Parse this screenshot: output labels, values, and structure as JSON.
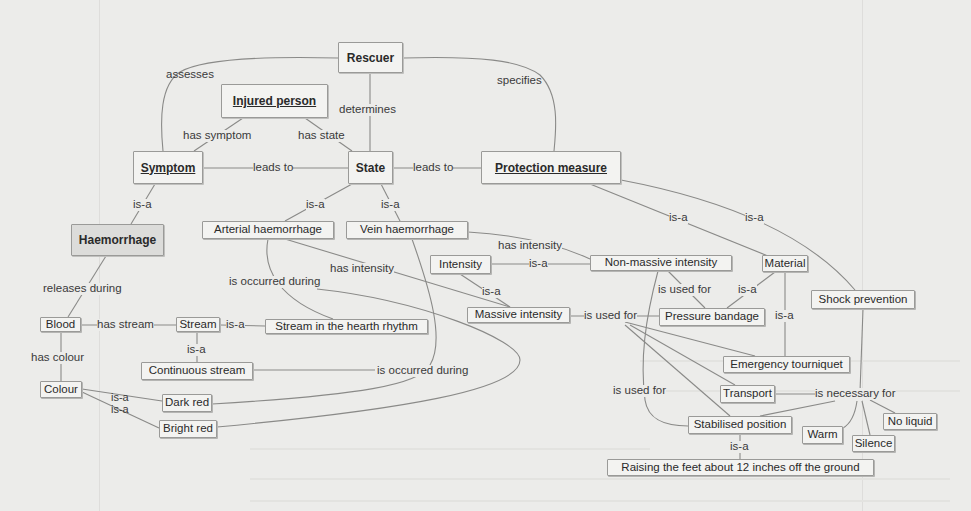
{
  "diagram": {
    "type": "concept-map",
    "nodes": {
      "rescuer": "Rescuer",
      "injured_person": "Injured person",
      "symptom": "Symptom",
      "state": "State",
      "protection_measure": "Protection measure",
      "haemorrhage": "Haemorrhage",
      "arterial_haemorrhage": "Arterial haemorrhage",
      "vein_haemorrhage": "Vein haemorrhage",
      "intensity": "Intensity",
      "non_massive_intensity": "Non-massive intensity",
      "material": "Material",
      "massive_intensity": "Massive intensity",
      "pressure_bandage": "Pressure bandage",
      "shock_prevention": "Shock prevention",
      "blood": "Blood",
      "stream": "Stream",
      "stream_heart_rhythm": "Stream in the hearth rhythm",
      "continuous_stream": "Continuous stream",
      "colour": "Colour",
      "dark_red": "Dark red",
      "bright_red": "Bright red",
      "emergency_tourniquet": "Emergency tourniquet",
      "transport": "Transport",
      "stabilised_position": "Stabilised position",
      "warm": "Warm",
      "silence": "Silence",
      "no_liquid": "No liquid",
      "raising_feet": "Raising the feet about 12 inches off the ground"
    },
    "links": {
      "assesses": "assesses",
      "determines": "determines",
      "specifies": "specifies",
      "has_symptom": "has symptom",
      "has_state": "has state",
      "leads_to_1": "leads to",
      "leads_to_2": "leads to",
      "isa_symptom_haem": "is-a",
      "isa_state_arterial": "is-a",
      "isa_state_vein": "is-a",
      "isa_pm_material": "is-a",
      "isa_pm_shock": "is-a",
      "has_intensity_vein": "has intensity",
      "has_intensity_arterial": "has intensity",
      "is_occurred_during_1": "is occurred during",
      "is_occurred_during_2": "is occurred during",
      "releases_during": "releases during",
      "isa_intensity_nonmassive": "is-a",
      "isa_intensity_massive": "is-a",
      "is_used_for_nonmassive": "is used for",
      "isa_material_pressure": "is-a",
      "isa_material_tourniquet": "is-a",
      "is_used_for_massive": "is used for",
      "is_used_for_left": "is used for",
      "has_stream": "has stream",
      "isa_stream_rhythm": "is-a",
      "isa_stream_continuous": "is-a",
      "has_colour": "has colour",
      "isa_colour_dark": "is-a",
      "isa_colour_bright": "is-a",
      "is_necessary_for": "is necessary for",
      "isa_stabilised_raising": "is-a"
    },
    "edges": [
      [
        "Rescuer",
        "assesses",
        "Symptom"
      ],
      [
        "Rescuer",
        "determines",
        "State"
      ],
      [
        "Rescuer",
        "specifies",
        "Protection measure"
      ],
      [
        "Injured person",
        "has symptom",
        "Symptom"
      ],
      [
        "Injured person",
        "has state",
        "State"
      ],
      [
        "Symptom",
        "leads to",
        "State"
      ],
      [
        "State",
        "leads to",
        "Protection measure"
      ],
      [
        "Haemorrhage",
        "is-a",
        "Symptom"
      ],
      [
        "Arterial haemorrhage",
        "is-a",
        "State"
      ],
      [
        "Vein haemorrhage",
        "is-a",
        "State"
      ],
      [
        "Material",
        "is-a",
        "Protection measure"
      ],
      [
        "Shock prevention",
        "is-a",
        "Protection measure"
      ],
      [
        "Vein haemorrhage",
        "has intensity",
        "Non-massive intensity"
      ],
      [
        "Arterial haemorrhage",
        "has intensity",
        "Massive intensity"
      ],
      [
        "Arterial haemorrhage",
        "is occurred during",
        "Stream in the hearth rhythm"
      ],
      [
        "Vein haemorrhage",
        "is occurred during",
        "Continuous stream"
      ],
      [
        "Haemorrhage",
        "releases during",
        "Blood"
      ],
      [
        "Non-massive intensity",
        "is-a",
        "Intensity"
      ],
      [
        "Massive intensity",
        "is-a",
        "Intensity"
      ],
      [
        "Pressure bandage",
        "is used for",
        "Non-massive intensity"
      ],
      [
        "Pressure bandage",
        "is-a",
        "Material"
      ],
      [
        "Emergency tourniquet",
        "is-a",
        "Material"
      ],
      [
        "Massive intensity",
        "is used for",
        "Pressure bandage"
      ],
      [
        "Massive intensity",
        "is used for",
        "Emergency tourniquet"
      ],
      [
        "Massive intensity",
        "is used for",
        "Transport"
      ],
      [
        "Massive intensity",
        "is used for",
        "Stabilised position"
      ],
      [
        "Stabilised position",
        "is used for",
        "Non-massive intensity"
      ],
      [
        "Blood",
        "has stream",
        "Stream"
      ],
      [
        "Stream in the hearth rhythm",
        "is-a",
        "Stream"
      ],
      [
        "Continuous stream",
        "is-a",
        "Stream"
      ],
      [
        "Blood",
        "has colour",
        "Colour"
      ],
      [
        "Dark red",
        "is-a",
        "Colour"
      ],
      [
        "Bright red",
        "is-a",
        "Colour"
      ],
      [
        "Shock prevention",
        "is necessary for",
        "Transport"
      ],
      [
        "Shock prevention",
        "is necessary for",
        "Stabilised position"
      ],
      [
        "Shock prevention",
        "is necessary for",
        "Warm"
      ],
      [
        "Shock prevention",
        "is necessary for",
        "Silence"
      ],
      [
        "Shock prevention",
        "is necessary for",
        "No liquid"
      ],
      [
        "Raising the feet about 12 inches off the ground",
        "is-a",
        "Stabilised position"
      ]
    ]
  }
}
